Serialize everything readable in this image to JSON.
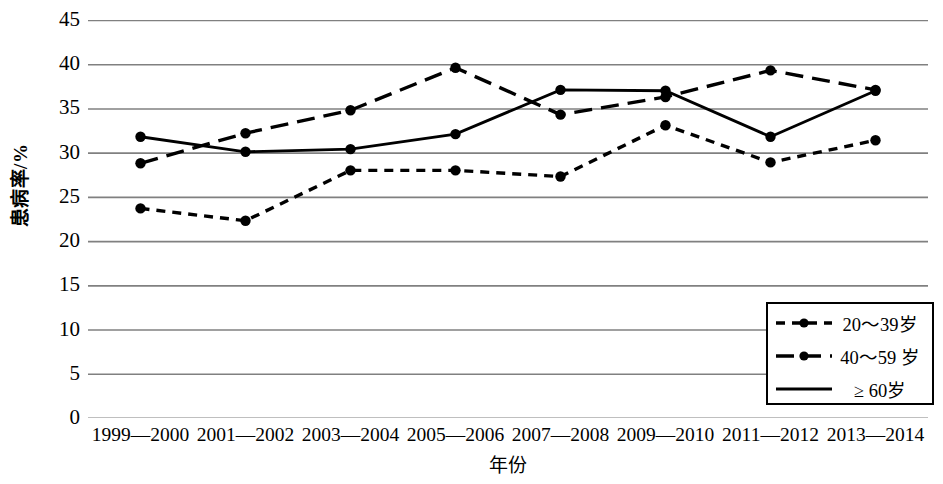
{
  "chart_data": {
    "type": "line",
    "title": "",
    "xlabel": "年份",
    "ylabel": "患病率/%",
    "ylim": [
      0,
      45
    ],
    "yticks": [
      0,
      5,
      10,
      15,
      20,
      25,
      30,
      35,
      40,
      45
    ],
    "grid": true,
    "legend_position": "bottom-right",
    "categories": [
      "1999—2000",
      "2001—2002",
      "2003—2004",
      "2005—2006",
      "2007—2008",
      "2009—2010",
      "2011—2012",
      "2013—2014"
    ],
    "series": [
      {
        "name": "20～39岁",
        "style": "dotted",
        "marker": "circle",
        "values": [
          23.7,
          22.3,
          28.0,
          28.0,
          27.3,
          33.1,
          28.9,
          31.4
        ]
      },
      {
        "name": "40～59岁",
        "style": "dashed",
        "marker": "circle",
        "values": [
          28.8,
          32.2,
          34.8,
          39.6,
          34.3,
          36.3,
          39.3,
          37.1
        ]
      },
      {
        "name": "≥60岁",
        "style": "solid",
        "marker": "circle",
        "values": [
          31.8,
          30.1,
          30.4,
          32.1,
          37.1,
          37.0,
          31.8,
          37.0
        ]
      }
    ]
  },
  "axes": {
    "y_title": "患病率/%",
    "x_title": "年份",
    "y_tick_labels": [
      "45",
      "40",
      "35",
      "30",
      "25",
      "20",
      "15",
      "10",
      "5",
      "0"
    ],
    "x_tick_labels": [
      "1999—2000",
      "2001—2002",
      "2003—2004",
      "2005—2006",
      "2007—2008",
      "2009—2010",
      "2011—2012",
      "2013—2014"
    ]
  },
  "legend": {
    "items": [
      {
        "label": "20～39岁",
        "style": "dotted"
      },
      {
        "label": "40～59 岁",
        "style": "dashed"
      },
      {
        "label": "≥ 60岁",
        "style": "solid"
      }
    ]
  },
  "colors": {
    "series_line": "#000000",
    "gridline": "#808080",
    "axis": "#000000",
    "background": "#ffffff"
  }
}
